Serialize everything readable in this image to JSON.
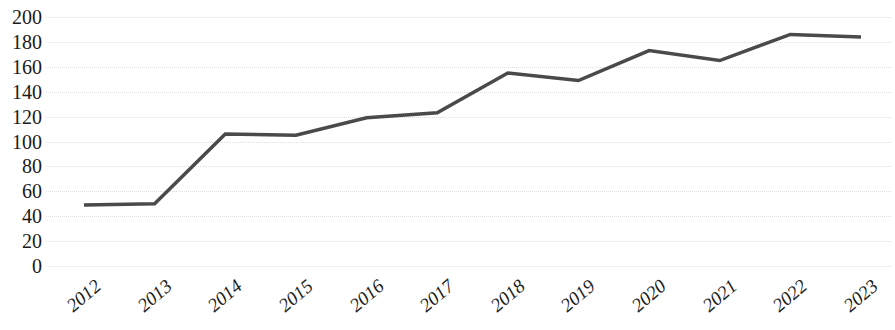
{
  "chart_data": {
    "type": "line",
    "title": "",
    "subtitle": "",
    "xlabel": "",
    "ylabel": "",
    "categories": [
      "2012",
      "2013",
      "2014",
      "2015",
      "2016",
      "2017",
      "2018",
      "2019",
      "2020",
      "2021",
      "2022",
      "2023"
    ],
    "values": [
      49,
      50,
      106,
      105,
      119,
      123,
      155,
      149,
      173,
      165,
      186,
      184
    ],
    "series": [
      {
        "name": "",
        "values": [
          49,
          50,
          106,
          105,
          119,
          123,
          155,
          149,
          173,
          165,
          186,
          184
        ],
        "color": "#4a4a4a"
      }
    ],
    "ylim": [
      0,
      200
    ],
    "y_ticks": [
      0,
      20,
      40,
      60,
      80,
      100,
      120,
      140,
      160,
      180,
      200
    ],
    "y_tick_labels": [
      "0",
      "20",
      "40",
      "60",
      "80",
      "100",
      "120",
      "140",
      "160",
      "180",
      "200"
    ],
    "x_tick_labels": [
      "2012",
      "2013",
      "2014",
      "2015",
      "2016",
      "2017",
      "2018",
      "2019",
      "2020",
      "2021",
      "2022",
      "2023"
    ],
    "grid": true,
    "grid_axis": "y",
    "grid_style": "dotted",
    "grid_color": "#dddddd",
    "legend": false,
    "legend_position": "none",
    "markers": false,
    "line_width": 3.5,
    "annotations": []
  },
  "colors": {
    "line": "#4a4a4a",
    "grid": "#dddddd",
    "text": "#1a1a1a",
    "background": "#ffffff"
  }
}
